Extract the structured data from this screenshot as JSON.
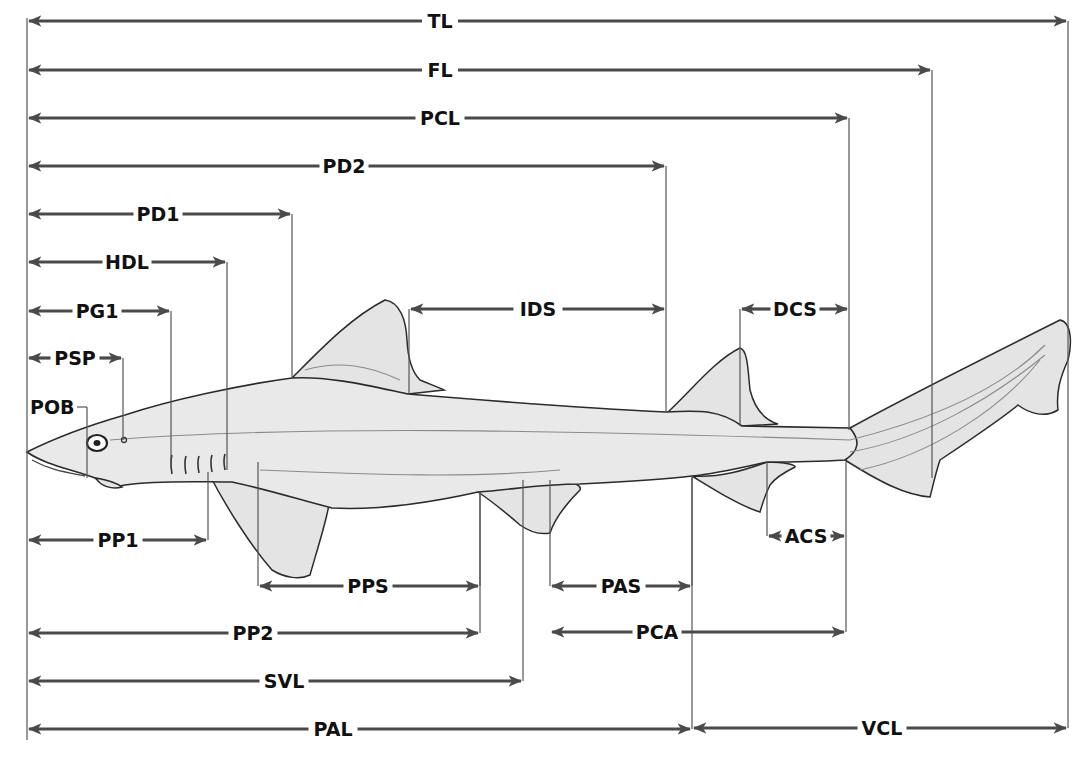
{
  "diagram": {
    "colors": {
      "dimension_line": "#4a4a4a",
      "reference_line": "#555555",
      "label_text": "#111111",
      "shark_fill": "#e9e9e9",
      "shark_outline": "#2b2b2b"
    },
    "origin_x": 27,
    "measurements": [
      {
        "id": "TL",
        "label": "TL",
        "y": 21,
        "x1": 27,
        "x2": 1068,
        "label_x": 440,
        "ref_bottom": 452
      },
      {
        "id": "FL",
        "label": "FL",
        "y": 70,
        "x1": 27,
        "x2": 932,
        "label_x": 440,
        "ref_bottom": 478
      },
      {
        "id": "PCL",
        "label": "PCL",
        "y": 118,
        "x1": 27,
        "x2": 849,
        "label_x": 440,
        "ref_bottom": 430
      },
      {
        "id": "PD2",
        "label": "PD2",
        "y": 166,
        "x1": 27,
        "x2": 666,
        "label_x": 344,
        "ref_bottom": 412
      },
      {
        "id": "PD1",
        "label": "PD1",
        "y": 214,
        "x1": 27,
        "x2": 292,
        "label_x": 158,
        "ref_bottom": 378
      },
      {
        "id": "HDL",
        "label": "HDL",
        "y": 262,
        "x1": 27,
        "x2": 227,
        "label_x": 127,
        "ref_bottom": 470
      },
      {
        "id": "PG1",
        "label": "PG1",
        "y": 311,
        "x1": 27,
        "x2": 171,
        "label_x": 97,
        "ref_bottom": 468
      },
      {
        "id": "PSP",
        "label": "PSP",
        "y": 358,
        "x1": 27,
        "x2": 123,
        "label_x": 75,
        "ref_bottom": 440
      },
      {
        "id": "IDS",
        "label": "IDS",
        "y": 309,
        "x1": 409,
        "x2": 666,
        "label_x": 538,
        "ref_top_left": 309,
        "ref_bottom_left": 394
      },
      {
        "id": "DCS",
        "label": "DCS",
        "y": 309,
        "x1": 740,
        "x2": 849,
        "label_x": 795,
        "ref_bottom_left": 426
      },
      {
        "id": "PP1",
        "label": "PP1",
        "y": 540,
        "x1": 27,
        "x2": 208,
        "label_x": 118,
        "ref_top": 472
      },
      {
        "id": "ACS",
        "label": "ACS",
        "y": 536,
        "x1": 767,
        "x2": 846,
        "label_x": 806,
        "ref_top_left": 462
      },
      {
        "id": "PPS",
        "label": "PPS",
        "y": 586,
        "x1": 258,
        "x2": 480,
        "label_x": 368,
        "ref_top_left": 462,
        "ref_top_right": 492
      },
      {
        "id": "PAS",
        "label": "PAS",
        "y": 586,
        "x1": 550,
        "x2": 692,
        "label_x": 621,
        "ref_top_left": 480,
        "ref_top_right": 476
      },
      {
        "id": "PP2",
        "label": "PP2",
        "y": 633,
        "x1": 27,
        "x2": 480,
        "label_x": 253,
        "ref_top": 492
      },
      {
        "id": "PCA",
        "label": "PCA",
        "y": 632,
        "x1": 550,
        "x2": 846,
        "label_x": 657,
        "ref_top_right": 462
      },
      {
        "id": "SVL",
        "label": "SVL",
        "y": 681,
        "x1": 27,
        "x2": 523,
        "label_x": 284,
        "ref_top": 480
      },
      {
        "id": "PAL",
        "label": "PAL",
        "y": 729,
        "x1": 27,
        "x2": 692,
        "label_x": 333,
        "ref_top": 476
      },
      {
        "id": "VCL",
        "label": "VCL",
        "y": 728,
        "x1": 692,
        "x2": 1068,
        "label_x": 882,
        "ref_top": 452
      }
    ],
    "pob": {
      "label": "POB",
      "x": 27,
      "y": 407,
      "right_x": 87,
      "ref_bottom": 478
    }
  }
}
